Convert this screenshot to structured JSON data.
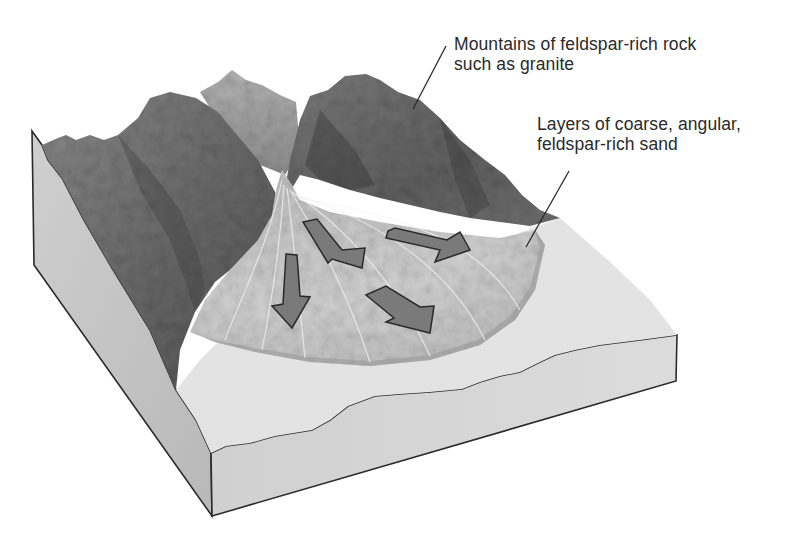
{
  "diagram": {
    "labels": [
      {
        "id": "mountains",
        "lines": [
          "Mountains of feldspar-rich rock",
          "such as granite"
        ]
      },
      {
        "id": "sand",
        "lines": [
          "Layers of coarse, angular,",
          "feldspar-rich sand"
        ]
      }
    ],
    "arrows": [
      {
        "id": "arrow-down",
        "direction": "south"
      },
      {
        "id": "arrow-southeast-upper",
        "direction": "south-east"
      },
      {
        "id": "arrow-east",
        "direction": "east"
      },
      {
        "id": "arrow-southeast-lower",
        "direction": "south-east"
      }
    ],
    "colors": {
      "background": "#ffffff",
      "block_side": "#c4c4c4",
      "block_front": "#d6d6d6",
      "plain_surface": "#e2e2e2",
      "fan_surface": "#cfcfcf",
      "rock_dark": "#5a5a5a",
      "rock_mid": "#7d7d7d",
      "rock_light": "#a8a8a8",
      "arrow_fill": "#7a7a7a",
      "outline": "#2a2a2a",
      "text": "#2a2a2a"
    }
  }
}
